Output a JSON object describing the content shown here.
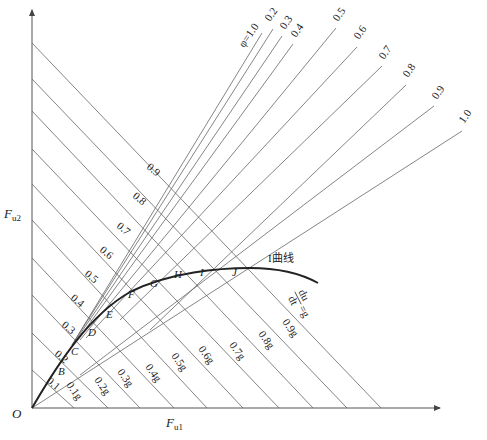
{
  "axes": {
    "x_label": "F",
    "x_sub": "u1",
    "y_label": "F",
    "y_sub": "u2",
    "origin": "O"
  },
  "iso_lines": {
    "phi_labels": [
      "0.1",
      "0.2",
      "0.3",
      "0.4",
      "0.5",
      "0.6",
      "0.7",
      "0.8",
      "0.9"
    ],
    "g_labels": [
      "0.1g",
      "0.2g",
      "0.3g",
      "0.4g",
      "0.5g",
      "0.6g",
      "0.7g",
      "0.8g",
      "0.9g"
    ],
    "g_caption_num": "du",
    "g_caption_den": "dt",
    "g_caption_rhs": "=g"
  },
  "fan_lines": {
    "labels": [
      "φ=1.0",
      "0.2",
      "0.3",
      "0.4",
      "0.5",
      "0.6",
      "0.7",
      "0.8",
      "0.9",
      "1.0"
    ]
  },
  "curve": {
    "label": "I曲线",
    "points": [
      "B",
      "C",
      "D",
      "E",
      "F",
      "G",
      "H",
      "I",
      "J"
    ]
  }
}
